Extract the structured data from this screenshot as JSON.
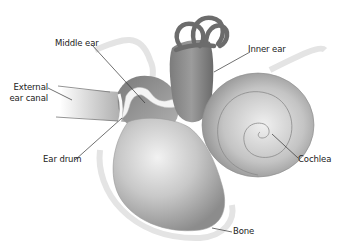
{
  "diagram": {
    "labels": {
      "middle_ear": "Middle ear",
      "inner_ear": "Inner ear",
      "external_line1": "External",
      "external_line2": "ear canal",
      "ear_drum": "Ear drum",
      "cochlea": "Cochlea",
      "bone": "Bone"
    },
    "colors": {
      "structure_dark": "#6e6e6e",
      "structure_mid": "#9a9a9a",
      "structure_light": "#d6d6d6",
      "bone_outline": "#e6e6e6",
      "leader_line": "#333333",
      "background": "#ffffff"
    }
  }
}
